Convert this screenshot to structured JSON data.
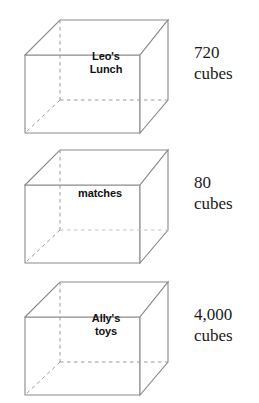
{
  "figure": {
    "title": "",
    "stroke_color": "#8a8a8a",
    "hidden_edge_color": "#9a9a9a",
    "face_color": "#ffffff",
    "background": "#ffffff",
    "shape_type": "rectangular prism",
    "boxes": [
      {
        "label": "Leo's\nLunch",
        "label_lines": [
          "Leo's",
          "Lunch"
        ],
        "count_value": "720",
        "count_unit": "cubes",
        "count_text": "720\ncubes"
      },
      {
        "label": "matches",
        "label_lines": [
          "matches"
        ],
        "count_value": "80",
        "count_unit": "cubes",
        "count_text": "80\ncubes"
      },
      {
        "label": "Ally's\ntoys",
        "label_lines": [
          "Ally's",
          "toys"
        ],
        "count_value": "4,000",
        "count_unit": "cubes",
        "count_text": "4,000\ncubes"
      }
    ]
  }
}
